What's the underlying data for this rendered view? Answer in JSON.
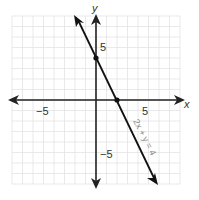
{
  "chart_data": {
    "type": "line",
    "title": "",
    "xlabel": "x",
    "ylabel": "y",
    "xlim": [
      -8,
      8
    ],
    "ylim": [
      -8,
      8
    ],
    "grid": true,
    "x_ticks_labeled": [
      -5,
      5
    ],
    "y_ticks_labeled": [
      5,
      -5
    ],
    "tick_labels": {
      "x_neg": "−5",
      "x_pos": "5",
      "y_pos": "5",
      "y_neg": "−5"
    },
    "series": [
      {
        "name": "2x + y = 4",
        "equation": "2x + y = 4",
        "slope": -2,
        "intercept": 4,
        "x": [
          -2,
          6
        ],
        "y": [
          8,
          -8
        ],
        "highlighted_points": [
          [
            0,
            4
          ],
          [
            2,
            0
          ]
        ]
      }
    ],
    "annotations": [
      {
        "text": "2x + y = 4",
        "rotation": 63
      }
    ]
  }
}
